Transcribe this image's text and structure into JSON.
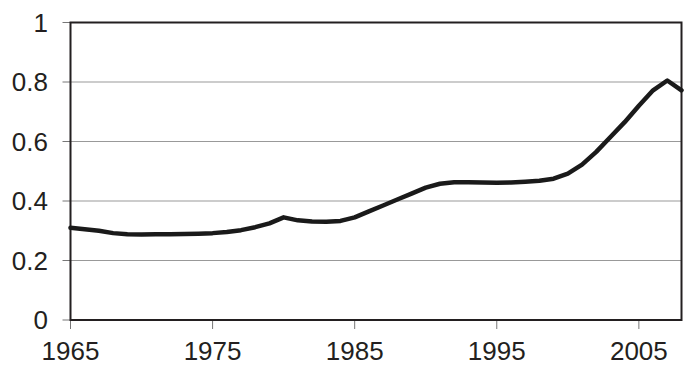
{
  "chart_data": {
    "type": "line",
    "title": "",
    "subtitle": "",
    "xlabel": "",
    "ylabel": "",
    "xlim": [
      1965,
      2008
    ],
    "ylim": [
      0,
      1
    ],
    "grid": true,
    "legend": false,
    "legend_position": "none",
    "series_color": "#1a1a1a",
    "axis_color": "#231f20",
    "gridline_color": "#999999",
    "background": "#ffffff",
    "y_ticks": [
      "0",
      "0.2",
      "0.4",
      "0.6",
      "0.8",
      "1"
    ],
    "y_tick_values": [
      0,
      0.2,
      0.4,
      0.6,
      0.8,
      1
    ],
    "x_ticks": [
      "1965",
      "1975",
      "1985",
      "1995",
      "2005"
    ],
    "x_tick_values": [
      1965,
      1975,
      1985,
      1995,
      2005
    ],
    "x": [
      1965,
      1966,
      1967,
      1968,
      1969,
      1970,
      1971,
      1972,
      1973,
      1974,
      1975,
      1976,
      1977,
      1978,
      1979,
      1980,
      1981,
      1982,
      1983,
      1984,
      1985,
      1986,
      1987,
      1988,
      1989,
      1990,
      1991,
      1992,
      1993,
      1994,
      1995,
      1996,
      1997,
      1998,
      1999,
      2000,
      2001,
      2002,
      2003,
      2004,
      2005,
      2006,
      2007,
      2008
    ],
    "values": [
      0.31,
      0.305,
      0.3,
      0.292,
      0.288,
      0.287,
      0.288,
      0.288,
      0.289,
      0.29,
      0.292,
      0.296,
      0.302,
      0.312,
      0.325,
      0.345,
      0.335,
      0.331,
      0.33,
      0.333,
      0.345,
      0.365,
      0.385,
      0.405,
      0.425,
      0.445,
      0.458,
      0.463,
      0.463,
      0.462,
      0.461,
      0.462,
      0.465,
      0.468,
      0.475,
      0.492,
      0.522,
      0.565,
      0.615,
      0.665,
      0.72,
      0.772,
      0.805,
      0.772
    ],
    "series": [
      {
        "name": "series-1",
        "values": [
          0.31,
          0.305,
          0.3,
          0.292,
          0.288,
          0.287,
          0.288,
          0.288,
          0.289,
          0.29,
          0.292,
          0.296,
          0.302,
          0.312,
          0.325,
          0.345,
          0.335,
          0.331,
          0.33,
          0.333,
          0.345,
          0.365,
          0.385,
          0.405,
          0.425,
          0.445,
          0.458,
          0.463,
          0.463,
          0.462,
          0.461,
          0.462,
          0.465,
          0.468,
          0.475,
          0.492,
          0.522,
          0.565,
          0.615,
          0.665,
          0.72,
          0.772,
          0.805,
          0.772
        ]
      }
    ]
  }
}
